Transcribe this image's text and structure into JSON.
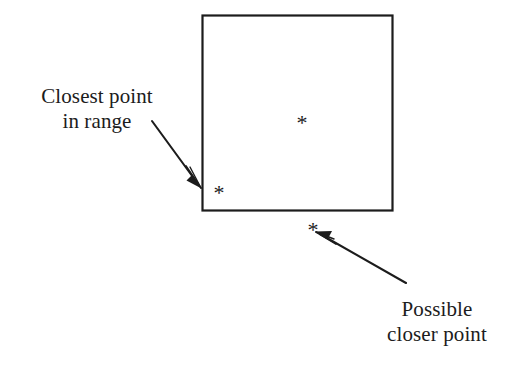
{
  "figure": {
    "background_color": "#ffffff",
    "stroke_color": "#1c1c1c",
    "annotations": {
      "closest_point": {
        "line1": "Closest point",
        "line2": "in range"
      },
      "possible_closer": {
        "line1": "Possible",
        "line2": "closer point"
      }
    },
    "points": {
      "inside_center_marker": "*",
      "inside_corner_marker": "*",
      "outside_below_marker": "*"
    },
    "shapes": {
      "range_square_label": "range-square"
    }
  }
}
